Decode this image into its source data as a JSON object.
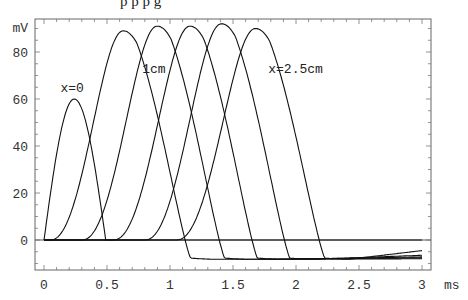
{
  "chart_data": {
    "type": "line",
    "title": "",
    "xlabel": "ms",
    "ylabel": "mV",
    "xlim": [
      0,
      3
    ],
    "ylim": [
      -12.8,
      94
    ],
    "grid": false,
    "legend": "none",
    "x_ticks": [
      {
        "value": 0,
        "label": "0"
      },
      {
        "value": 0.5,
        "label": "0.5"
      },
      {
        "value": 1,
        "label": "1"
      },
      {
        "value": 1.5,
        "label": "1.5"
      },
      {
        "value": 2,
        "label": "2"
      },
      {
        "value": 2.5,
        "label": "2.5"
      },
      {
        "value": 3,
        "label": "3"
      }
    ],
    "y_ticks": [
      {
        "value": 0,
        "label": "0"
      },
      {
        "value": 20,
        "label": "20"
      },
      {
        "value": 40,
        "label": "40"
      },
      {
        "value": 60,
        "label": "60"
      },
      {
        "value": 80,
        "label": "80"
      }
    ],
    "annotations": [
      {
        "text": "x=0",
        "x": 0.13,
        "y": 63
      },
      {
        "text": "1cm",
        "x": 0.78,
        "y": 71
      },
      {
        "text": "x=2.5cm",
        "x": 1.78,
        "y": 71
      }
    ],
    "series": [
      {
        "name": "x=0",
        "onset": 0.0,
        "peak_t": 0.24,
        "peak_v": 60,
        "end_t": 0.49,
        "undershoot": 0,
        "tail_end": 0
      },
      {
        "name": "x=0.5cm",
        "onset": 0.05,
        "peak_t": 0.63,
        "peak_v": 89,
        "end_t": 1.35,
        "undershoot": -8.5,
        "tail_end": -8.0
      },
      {
        "name": "x=1cm",
        "onset": 0.3,
        "peak_t": 0.9,
        "peak_v": 91,
        "end_t": 1.62,
        "undershoot": -8.5,
        "tail_end": -7.6
      },
      {
        "name": "x=1.5cm",
        "onset": 0.55,
        "peak_t": 1.16,
        "peak_v": 91,
        "end_t": 1.88,
        "undershoot": -8.5,
        "tail_end": -7.2
      },
      {
        "name": "x=2cm",
        "onset": 0.8,
        "peak_t": 1.41,
        "peak_v": 92,
        "end_t": 2.14,
        "undershoot": -8.5,
        "tail_end": -6.5
      },
      {
        "name": "x=2.5cm",
        "onset": 1.05,
        "peak_t": 1.68,
        "peak_v": 90,
        "end_t": 2.42,
        "undershoot": -8.5,
        "tail_end": -4.5
      }
    ]
  },
  "page": {
    "clipped_caption": "p              p                                                    p                  g"
  }
}
